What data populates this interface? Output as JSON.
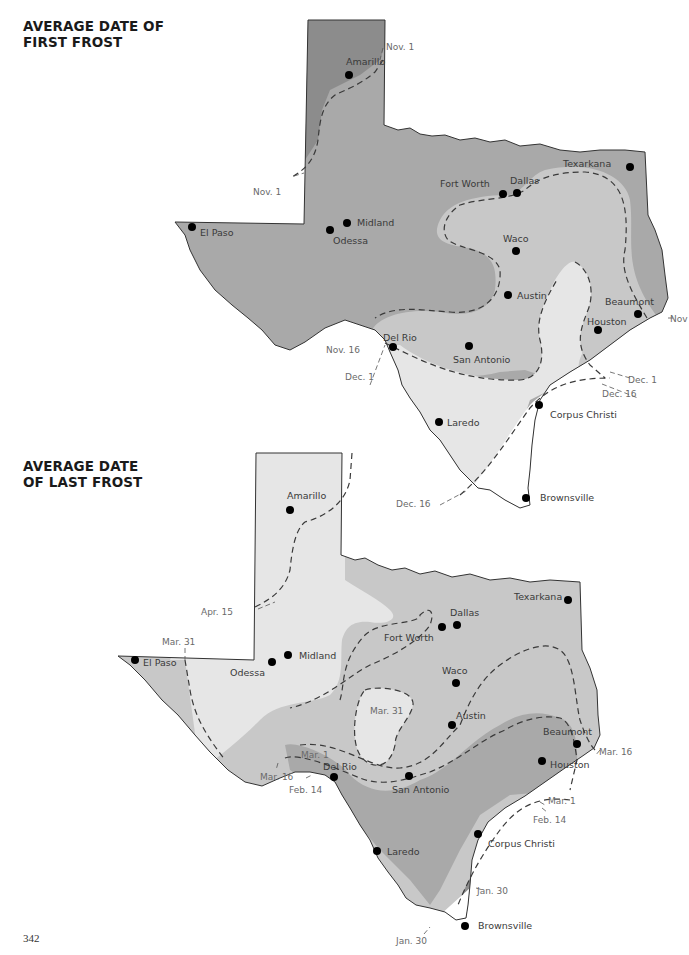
{
  "page": {
    "number": "342"
  },
  "colors": {
    "darkest": "#8c8c8c",
    "dark": "#a9a9a9",
    "medium": "#c8c8c8",
    "light": "#e6e6e6",
    "white": "#ffffff",
    "city_dot": "#000000"
  },
  "first_frost_map": {
    "title_line1": "AVERAGE DATE OF",
    "title_line2": "FIRST FROST",
    "cities": {
      "amarillo": "Amarillo",
      "el_paso": "El Paso",
      "midland": "Midland",
      "odessa": "Odessa",
      "fort_worth": "Fort Worth",
      "dallas": "Dallas",
      "texarkana": "Texarkana",
      "waco": "Waco",
      "austin": "Austin",
      "beaumont": "Beaumont",
      "houston": "Houston",
      "del_rio": "Del Rio",
      "san_antonio": "San Antonio",
      "laredo": "Laredo",
      "corpus_christi": "Corpus Christi",
      "brownsville": "Brownsville"
    },
    "isolines": {
      "nov1_top": "Nov. 1",
      "nov1_left": "Nov. 1",
      "nov_right": "Nov",
      "nov16": "Nov. 16",
      "dec1_left": "Dec. 1",
      "dec1_right": "Dec. 1",
      "dec16_right": "Dec. 16",
      "dec16_bottom": "Dec. 16"
    }
  },
  "last_frost_map": {
    "title_line1": "AVERAGE DATE",
    "title_line2": "OF LAST FROST",
    "cities": {
      "amarillo": "Amarillo",
      "el_paso": "El Paso",
      "midland": "Midland",
      "odessa": "Odessa",
      "fort_worth": "Fort Worth",
      "dallas": "Dallas",
      "texarkana": "Texarkana",
      "waco": "Waco",
      "austin": "Austin",
      "beaumont": "Beaumont",
      "houston": "Houston",
      "del_rio": "Del Rio",
      "san_antonio": "San Antonio",
      "laredo": "Laredo",
      "corpus_christi": "Corpus Christi",
      "brownsville": "Brownsville"
    },
    "isolines": {
      "apr15": "Apr. 15",
      "mar31_left": "Mar. 31",
      "mar31_island": "Mar. 31",
      "mar1_left": "Mar. 1",
      "mar16_left": "Mar. 16",
      "feb14_left": "Feb. 14",
      "mar16_right": "Mar. 16",
      "mar1_right": "Mar. 1",
      "feb14_right": "Feb. 14",
      "jan30_right": "Jan. 30",
      "jan30_bottom": "Jan. 30"
    }
  }
}
